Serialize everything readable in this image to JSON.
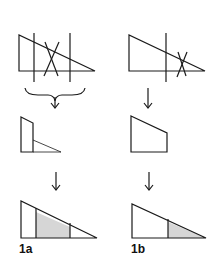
{
  "figure": {
    "panels": [
      {
        "id": "1a",
        "label": "1a",
        "steps": [
          "triangle cut by two vertical lines with cross",
          "trapezoid with inner divider",
          "triangle with shaded middle band"
        ]
      },
      {
        "id": "1b",
        "label": "1b",
        "steps": [
          "triangle cut by one vertical line with cross near tip",
          "trapezoid",
          "triangle with shaded tip region"
        ]
      }
    ],
    "colors": {
      "stroke": "#1a1a1a",
      "shade": "#d6d6d6",
      "background": "#ffffff"
    }
  }
}
